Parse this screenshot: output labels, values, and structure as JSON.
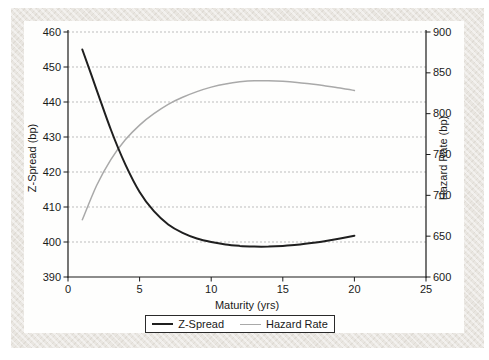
{
  "figure": {
    "panel_background": "#e9e6e1",
    "chart_background": "#fefefd",
    "text_color": "#1a1a1a",
    "gridline_color": "#bdbdbd"
  },
  "chart_data": {
    "type": "line",
    "x": [
      1,
      2,
      3,
      4,
      5,
      6,
      7,
      8,
      9,
      10,
      11,
      12,
      13,
      14,
      15,
      16,
      17,
      18,
      19,
      20
    ],
    "series": [
      {
        "name": "Z-Spread",
        "axis": "left",
        "color": "#1f1f1f",
        "width": 2,
        "values": [
          455,
          443.5,
          432,
          422.2,
          414.3,
          408.8,
          405,
          402.6,
          401,
          400,
          399.3,
          398.9,
          398.7,
          398.7,
          398.9,
          399.2,
          399.7,
          400.3,
          401,
          401.8
        ]
      },
      {
        "name": "Hazard Rate",
        "axis": "right",
        "color": "#a9a9a9",
        "width": 1.5,
        "values": [
          670,
          712,
          744,
          768,
          786,
          800,
          811.5,
          820,
          827,
          832.5,
          836.5,
          839,
          840.3,
          840.4,
          839.6,
          838.2,
          836.3,
          834,
          831.3,
          828.3
        ]
      }
    ],
    "x_axis": {
      "label": "Maturity (yrs)",
      "min": 0,
      "max": 25,
      "ticks": [
        0,
        5,
        10,
        15,
        20,
        25
      ]
    },
    "left_axis": {
      "label": "Z-Spread (bp)",
      "min": 390,
      "max": 460,
      "ticks": [
        390,
        400,
        410,
        420,
        430,
        440,
        450,
        460
      ]
    },
    "right_axis": {
      "label": "Hazard Rate (bp)",
      "min": 600,
      "max": 900,
      "ticks": [
        600,
        650,
        700,
        750,
        800,
        850,
        900
      ]
    },
    "grid": {
      "horizontal": "dashed",
      "vertical": false,
      "follows": "left-axis-ticks"
    },
    "legend": {
      "position": "bottom",
      "entries": [
        "Z-Spread",
        "Hazard Rate"
      ]
    }
  }
}
